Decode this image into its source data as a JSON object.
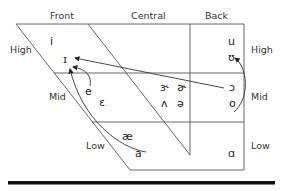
{
  "columns": {
    "front": "Front",
    "central": "Central",
    "back": "Back"
  },
  "rows": {
    "left": {
      "high": "High",
      "mid": "Mid",
      "low": "Low"
    },
    "right": {
      "high": "High",
      "mid": "Mid",
      "low": "Low"
    }
  },
  "vowels": {
    "i": "i",
    "small_i": "ɪ",
    "e": "e",
    "epsilon": "ɛ",
    "ae": "æ",
    "a": "a",
    "r_schwa": "ɝ",
    "schwa_hook": "ɚ",
    "wedge": "ʌ",
    "schwa": "ə",
    "u": "u",
    "upsilon": "ʊ",
    "open_o": "ɔ",
    "o": "o",
    "script_a": "ɑ"
  },
  "arrows": [
    {
      "from": "e",
      "to": "ɪ"
    },
    {
      "from": "a",
      "to": "ɪ"
    },
    {
      "from": "ɔ",
      "to": "ɪ"
    },
    {
      "from": "o",
      "to": "ʊ"
    }
  ]
}
